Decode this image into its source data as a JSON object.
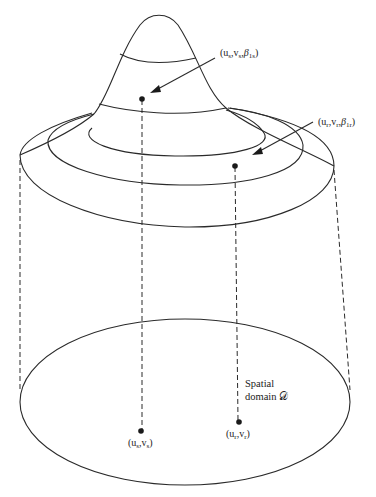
{
  "diagram": {
    "title": "",
    "labels": {
      "peak_point": "(u_s,v_s,β_1s)",
      "ring_point": "(u_r,v_r,β_1r)",
      "domain_line1": "Spatial",
      "domain_line2": "domain 𝒟",
      "base_point_s": "(u_s,v_s)",
      "base_point_r": "(u_r,v_r)"
    },
    "label_parts": {
      "peak_point": {
        "open": "(u",
        "s1": "s",
        "c1": ",v",
        "s2": "s",
        "c2": ",",
        "beta": "β",
        "s3": "1s",
        "close": ")"
      },
      "ring_point": {
        "open": "(u",
        "s1": "r",
        "c1": ",v",
        "s2": "r",
        "c2": ",",
        "beta": "β",
        "s3": "1r",
        "close": ")"
      },
      "base_point_s": {
        "open": "(u",
        "s1": "s",
        "c1": ",v",
        "s2": "s",
        "close": ")"
      },
      "base_point_r": {
        "open": "(u",
        "s1": "r",
        "c1": ",v",
        "s2": "r",
        "close": ")"
      }
    },
    "colors": {
      "stroke": "#2a2a2a",
      "background": "#ffffff"
    }
  }
}
